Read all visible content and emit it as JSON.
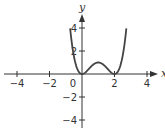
{
  "chart_data": {
    "type": "line",
    "title": "",
    "xlabel": "x",
    "ylabel": "y",
    "function": "y = x^2 (x - 2)^2",
    "xlim": [
      -4.8,
      4.8
    ],
    "ylim": [
      -5,
      5
    ],
    "x_ticks": [
      -4,
      -2,
      0,
      2,
      4
    ],
    "y_ticks": [
      -4,
      -2,
      2,
      4
    ],
    "x_tick_labels": [
      "-4",
      "-2",
      "0",
      "2",
      "4"
    ],
    "y_tick_labels": [
      "-4",
      "-2",
      "2",
      "4"
    ],
    "grid": false,
    "legend": null,
    "series": [
      {
        "name": "f(x)",
        "x": [
          -0.73,
          -0.5,
          -0.25,
          0,
          0.25,
          0.5,
          0.75,
          1,
          1.25,
          1.5,
          1.75,
          2,
          2.25,
          2.5,
          2.73
        ],
        "values": [
          4.0,
          1.5625,
          0.3164,
          0,
          0.1914,
          0.5625,
          0.8789,
          1.0,
          0.8789,
          0.5625,
          0.1914,
          0,
          0.3164,
          1.5625,
          4.0
        ]
      }
    ],
    "colors": {
      "axis": "#333333",
      "curve": "#444444"
    }
  }
}
